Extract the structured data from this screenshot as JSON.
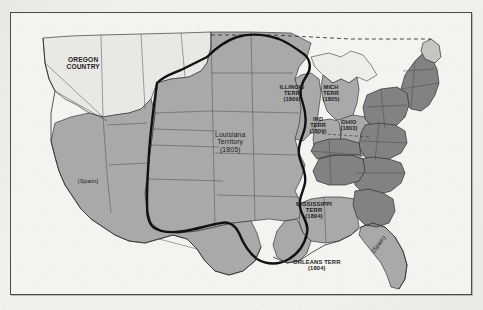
{
  "page": {
    "background_color": "#f1f0ed",
    "frame_border_color": "#4a4a4a",
    "map_background_color": "#f4f3f0"
  },
  "colors": {
    "territory_fill_medium": "#a9a9a9",
    "states_fill_dark": "#828282",
    "unfilled_fill_light": "#e9e8e5",
    "boundary_line": "#2b2b2b",
    "purchase_outline": "#111111",
    "text": "#1d1d1d"
  },
  "map": {
    "title_visible": false,
    "labels": [
      {
        "id": "oregon-country",
        "lines": [
          "OREGON",
          "COUNTRY"
        ],
        "x": 82,
        "y": 62,
        "size": 6.6,
        "weight": "600"
      },
      {
        "id": "spain-west",
        "lines": [
          "(Spain)"
        ],
        "x": 87,
        "y": 180,
        "size": 6.2,
        "weight": "400"
      },
      {
        "id": "louisiana-territory",
        "lines": [
          "Louisiana",
          "Territory",
          "(1805)"
        ],
        "x": 229,
        "y": 141,
        "size": 6.8,
        "weight": "400"
      },
      {
        "id": "illinois-terr",
        "lines": [
          "ILLINOIS",
          "TERR",
          "(1809)"
        ],
        "x": 291,
        "y": 92,
        "size": 5.6,
        "weight": "600"
      },
      {
        "id": "michigan-terr",
        "lines": [
          "MICH",
          "TERR",
          "(1805)"
        ],
        "x": 330,
        "y": 92,
        "size": 5.6,
        "weight": "600"
      },
      {
        "id": "indiana-terr",
        "lines": [
          "IND",
          "TERR",
          "(1809)"
        ],
        "x": 317,
        "y": 124,
        "size": 5.6,
        "weight": "600"
      },
      {
        "id": "ohio",
        "lines": [
          "OHIO",
          "(1803)"
        ],
        "x": 348,
        "y": 124,
        "size": 5.6,
        "weight": "600"
      },
      {
        "id": "mississippi-terr",
        "lines": [
          "MISSISSIPPI",
          "TERR",
          "(1804)"
        ],
        "x": 313,
        "y": 209,
        "size": 5.8,
        "weight": "600"
      },
      {
        "id": "orleans-terr",
        "lines": [
          "ORLEANS TERR",
          "(1804)"
        ],
        "x": 316,
        "y": 264,
        "size": 5.8,
        "weight": "600"
      }
    ],
    "rotated_labels": [
      {
        "id": "spain-florida",
        "text": "(Spain)",
        "x": 377,
        "y": 243,
        "rotate": -52,
        "size": 6.0
      }
    ],
    "bleed_through_text": [
      {
        "text": "Settling the West",
        "x": 330,
        "y": 22,
        "size": 13
      },
      {
        "text": "1800 - 1860",
        "x": 336,
        "y": 38,
        "size": 12
      }
    ]
  }
}
